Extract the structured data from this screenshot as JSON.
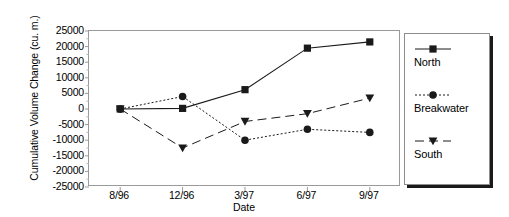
{
  "chart_data": {
    "type": "line",
    "title": "",
    "xlabel": "Date",
    "ylabel": "Cumulative Volume Change (cu. m.)",
    "categories": [
      "8/96",
      "12/96",
      "3/97",
      "6/97",
      "9/97"
    ],
    "ylim": [
      -25000,
      25000
    ],
    "yticks": [
      25000,
      20000,
      15000,
      10000,
      5000,
      0,
      -5000,
      -10000,
      -15000,
      -20000,
      -25000
    ],
    "ytick_labels": [
      "25000",
      "20000",
      "15000",
      "10000",
      "5000",
      "0",
      "-5000",
      "-10000",
      "-15000",
      "-20000",
      "-25000"
    ],
    "grid": false,
    "legend_position": "right-outside",
    "series": [
      {
        "name": "North",
        "values": [
          0,
          200,
          6200,
          19500,
          21500
        ],
        "marker": "square",
        "line_style": "solid",
        "color": "#1a1a1a"
      },
      {
        "name": "Breakwater",
        "values": [
          0,
          4000,
          -10000,
          -6500,
          -7500
        ],
        "marker": "circle",
        "line_style": "dotted",
        "color": "#1a1a1a"
      },
      {
        "name": "South",
        "values": [
          0,
          -12500,
          -4000,
          -1500,
          3500
        ],
        "marker": "triangle-down",
        "line_style": "dashed",
        "color": "#1a1a1a"
      }
    ]
  },
  "legend": {
    "entries": [
      {
        "label": "North"
      },
      {
        "label": "Breakwater"
      },
      {
        "label": "South"
      }
    ]
  }
}
